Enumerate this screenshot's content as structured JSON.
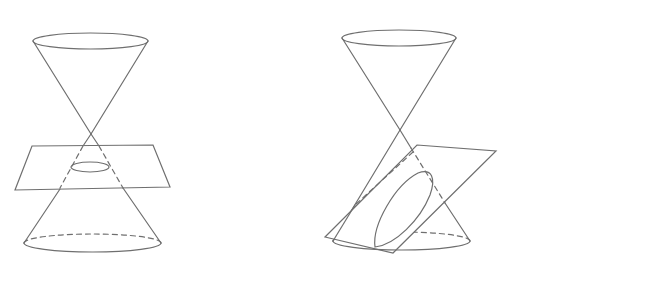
{
  "figures": [
    {
      "id": "circle-section",
      "description": "Double cone cut by a horizontal plane producing a circle",
      "cone": {
        "apex": [
          91,
          134
        ],
        "top_ellipse": {
          "cx": 90.5,
          "cy": 41,
          "rx": 57.5,
          "ry": 8
        },
        "bottom_ellipse": {
          "cx": 92.5,
          "cy": 243,
          "rx": 68.5,
          "ry": 9
        }
      },
      "plane": {
        "corners": [
          [
            32,
            146
          ],
          [
            153,
            145
          ],
          [
            170,
            187
          ],
          [
            15,
            190
          ]
        ]
      },
      "section": {
        "shape": "circle",
        "cx": 90,
        "cy": 167,
        "rx": 19,
        "ry": 5
      }
    },
    {
      "id": "ellipse-section",
      "description": "Double cone cut by a tilted plane producing an ellipse",
      "cone": {
        "apex": [
          400,
          130
        ],
        "top_ellipse": {
          "cx": 399,
          "cy": 38,
          "rx": 57,
          "ry": 8
        },
        "bottom_ellipse": {
          "cx": 401.5,
          "cy": 241,
          "rx": 68.5,
          "ry": 9
        }
      },
      "plane": {
        "corners": [
          [
            417,
            145
          ],
          [
            496,
            151
          ],
          [
            393,
            253
          ],
          [
            325,
            237
          ]
        ]
      },
      "section": {
        "shape": "ellipse"
      }
    }
  ],
  "style": {
    "stroke_color": "#6f6f6f",
    "background": "#ffffff"
  }
}
